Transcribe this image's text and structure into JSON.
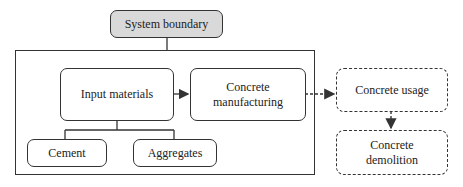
{
  "diagram": {
    "system_boundary_label": "System boundary",
    "nodes": {
      "input_materials": "Input materials",
      "concrete_manufacturing_line1": "Concrete",
      "concrete_manufacturing_line2": "manufacturing",
      "cement": "Cement",
      "aggregates": "Aggregates",
      "concrete_usage": "Concrete usage",
      "concrete_demolition_line1": "Concrete",
      "concrete_demolition_line2": "demolition"
    },
    "edges": [
      {
        "from": "System boundary",
        "to": "boundary-frame",
        "style": "solid"
      },
      {
        "from": "Input materials",
        "to": "Concrete manufacturing",
        "style": "solid-arrow"
      },
      {
        "from": "Input materials",
        "to": "Cement",
        "style": "solid"
      },
      {
        "from": "Input materials",
        "to": "Aggregates",
        "style": "solid"
      },
      {
        "from": "Concrete manufacturing",
        "to": "Concrete usage",
        "style": "dashed-arrow"
      },
      {
        "from": "Concrete usage",
        "to": "Concrete demolition",
        "style": "dashed-arrow"
      }
    ],
    "colors": {
      "line": "#333333",
      "boundary_fill": "#d9d9d9",
      "box_fill": "#ffffff"
    }
  }
}
